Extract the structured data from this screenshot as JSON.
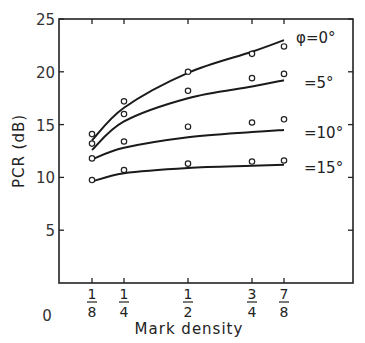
{
  "chart_data": {
    "type": "line",
    "title": "",
    "xlabel": "Mark density",
    "ylabel": "PCR (dB)",
    "x": [
      0.125,
      0.25,
      0.5,
      0.75,
      0.875
    ],
    "x_tick_labels": [
      {
        "num": "1",
        "den": "8",
        "value": 0.125
      },
      {
        "num": "1",
        "den": "4",
        "value": 0.25
      },
      {
        "num": "1",
        "den": "2",
        "value": 0.5
      },
      {
        "num": "3",
        "den": "4",
        "value": 0.75
      },
      {
        "num": "7",
        "den": "8",
        "value": 0.875
      }
    ],
    "x_origin_label": "0",
    "y_ticks": [
      5,
      10,
      15,
      20,
      25
    ],
    "y_tick_labels": [
      "5",
      "10",
      "15",
      "20",
      "25"
    ],
    "ylim": [
      0,
      25
    ],
    "xlim": [
      0,
      1.15
    ],
    "grid": false,
    "legend_position": "right of curves (inline labels)",
    "series": [
      {
        "name": "φ=0°",
        "label": "φ=0°",
        "measured": [
          14.1,
          17.2,
          20.0,
          21.7,
          22.4
        ],
        "fitted": [
          13.5,
          16.6,
          19.9,
          21.9,
          23.0
        ]
      },
      {
        "name": "φ=5°",
        "label": "=5°",
        "measured": [
          13.2,
          16.0,
          18.2,
          19.4,
          19.8
        ],
        "fitted": [
          12.6,
          15.3,
          17.5,
          18.6,
          19.2
        ]
      },
      {
        "name": "φ=10°",
        "label": "=10°",
        "measured": [
          11.8,
          13.4,
          14.8,
          15.2,
          15.5
        ],
        "fitted": [
          11.7,
          12.8,
          13.8,
          14.3,
          14.5
        ]
      },
      {
        "name": "φ=15°",
        "label": "=15°",
        "measured": [
          9.75,
          10.7,
          11.3,
          11.5,
          11.6
        ],
        "fitted": [
          9.6,
          10.4,
          10.9,
          11.1,
          11.2
        ]
      }
    ],
    "markers": "open circles = measured, solid lines = theoretical"
  }
}
